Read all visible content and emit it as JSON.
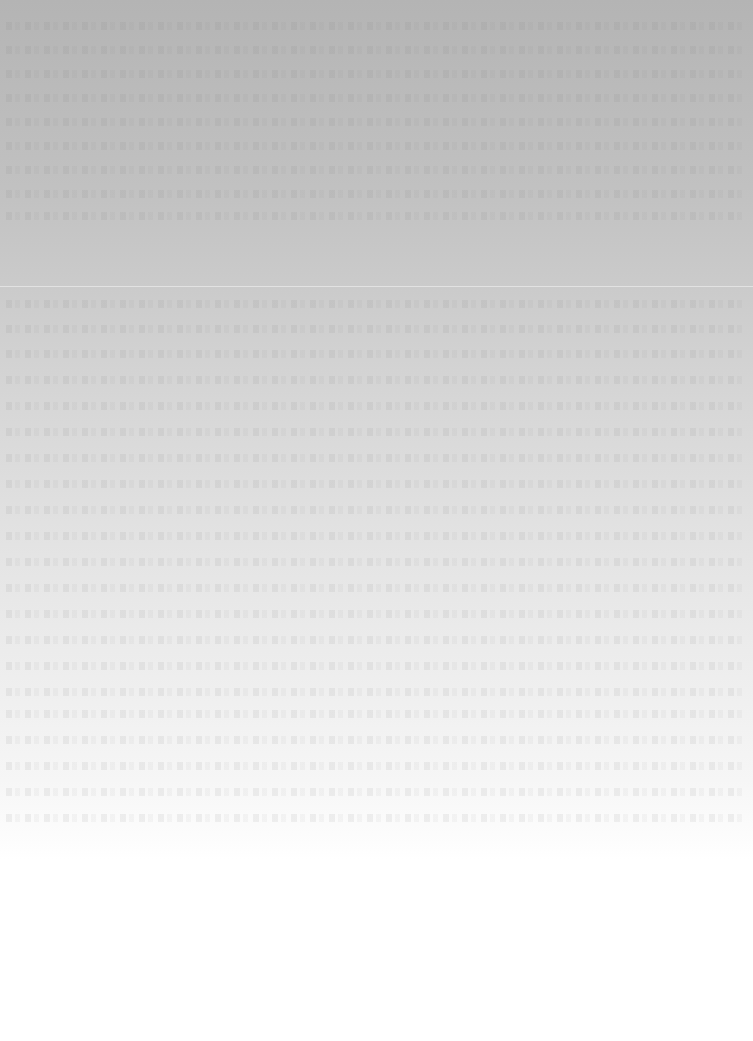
{
  "document": {
    "legibility": "illegible",
    "text_lines_top_count": 9,
    "text_lines_body_count": 23,
    "colors": {
      "top_tone": "#b4b4b4",
      "bottom_tone": "#ffffff"
    }
  }
}
